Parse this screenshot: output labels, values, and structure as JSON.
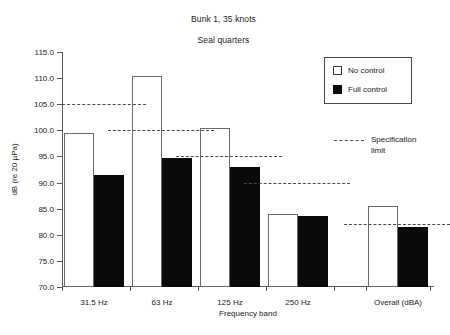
{
  "chart_data": {
    "type": "bar",
    "title": "Bunk 1, 35 knots",
    "subtitle": "Seal quarters",
    "xlabel": "Frequency band",
    "ylabel": "dB (re 20 µPa)",
    "ylim": [
      70.0,
      115.0
    ],
    "ytick_step": 5.0,
    "grid": false,
    "legend_position": "top-right",
    "categories": [
      "31.5 Hz",
      "63 Hz",
      "125 Hz",
      "250 Hz",
      "Overall (dBA)"
    ],
    "series": [
      {
        "name": "No control",
        "color": "#ffffff",
        "values": [
          99.5,
          110.5,
          100.5,
          84.0,
          85.5
        ]
      },
      {
        "name": "Full control",
        "color": "#0a0a0a",
        "values": [
          91.5,
          94.8,
          93.0,
          83.6,
          81.5
        ]
      }
    ],
    "specification_limit": {
      "label": "Specification\nlimit",
      "style": "dashed",
      "values": [
        105.0,
        100.0,
        95.0,
        90.0,
        82.0
      ]
    },
    "ytick_labels": [
      "115.0",
      "110.0",
      "105.0",
      "100.0",
      "95.0",
      "90.0",
      "85.0",
      "80.0",
      "75.0",
      "70.0"
    ],
    "ytick_values": [
      115.0,
      110.0,
      105.0,
      100.0,
      95.0,
      90.0,
      85.0,
      80.0,
      75.0,
      70.0
    ]
  },
  "legend": {
    "items": [
      {
        "label": "No control",
        "swatch": "open-square-icon"
      },
      {
        "label": "Full control",
        "swatch": "filled-square-icon"
      }
    ],
    "spec_label": "Specification\nlimit"
  }
}
